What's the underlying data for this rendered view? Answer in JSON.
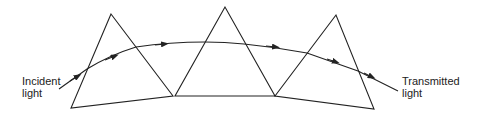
{
  "diagram": {
    "labels": {
      "incident_line1": "Incident",
      "incident_line2": "light",
      "transmitted_line1": "Transmitted",
      "transmitted_line2": "light"
    },
    "prism_count": 3,
    "line_color": "#222222"
  }
}
